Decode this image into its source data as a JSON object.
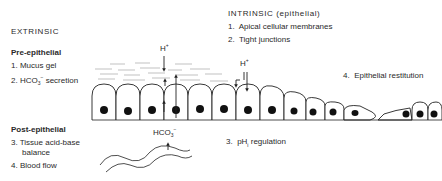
{
  "extrinsic": {
    "title": "EXTRINSIC",
    "pre_epithelial": {
      "heading": "Pre-epithelial",
      "items": [
        {
          "num": "1.",
          "text": "Mucus gel"
        },
        {
          "num": "2.",
          "text": "HCO",
          "sub": "3",
          "sup": "−",
          "suffix": "secretion"
        }
      ]
    },
    "post_epithelial": {
      "heading": "Post-epithelial",
      "items": [
        {
          "num": "3.",
          "text": "Tissue acid-base",
          "line2": "balance"
        },
        {
          "num": "4.",
          "text": "Blood flow"
        }
      ]
    }
  },
  "intrinsic": {
    "title": "INTRINSIC (epithelial)",
    "items": [
      {
        "num": "1.",
        "text": "Apical cellular membranes"
      },
      {
        "num": "2.",
        "text": "Tight junctions"
      },
      {
        "num": "3.",
        "text": "pH",
        "sub": "i",
        "suffix": "regulation"
      },
      {
        "num": "4.",
        "text": "Epithelial restitution"
      }
    ]
  },
  "diagram_labels": {
    "h_plus_left": "H",
    "h_plus_right": "H",
    "plus": "+",
    "hco3": "HCO",
    "hco3_sub": "3",
    "hco3_sup": "−"
  }
}
